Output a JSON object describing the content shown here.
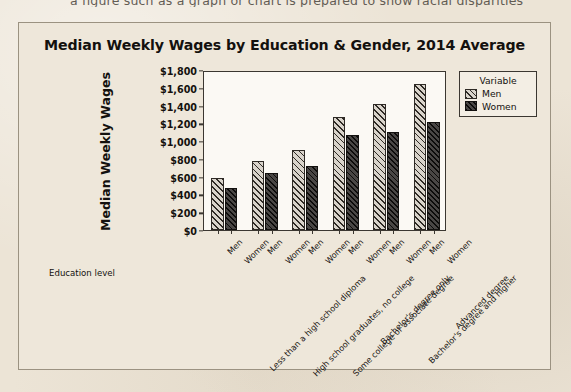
{
  "page": {
    "cut_off_line": "a figure such as a graph or chart is prepared to show racial disparities",
    "background_color": "#ece4d6"
  },
  "chart_data": {
    "type": "bar",
    "title": "Median Weekly Wages by Education & Gender, 2014 Average",
    "xlabel": "Education level",
    "ylabel": "Median Weekly Wages",
    "ylim": [
      0,
      1800
    ],
    "grid": false,
    "legend_position": "right",
    "legend_title": "Variable",
    "yticks": [
      "$0",
      "$200",
      "$400",
      "$600",
      "$800",
      "$1,000",
      "$1,200",
      "$1,400",
      "$1,600",
      "$1,800"
    ],
    "ytick_values": [
      0,
      200,
      400,
      600,
      800,
      1000,
      1200,
      1400,
      1600,
      1800
    ],
    "categories": [
      "Less than a high school diploma",
      "High school graduates, no college",
      "Some college or associate degree",
      "Bachelor's degree only",
      "Bachelor's degree and higher",
      "Advanced degree"
    ],
    "group_tick_labels": [
      "Men",
      "Women"
    ],
    "series": [
      {
        "name": "Men",
        "pattern": "diagonal-hatch-light",
        "values": [
          580,
          780,
          895,
          1270,
          1415,
          1640
        ]
      },
      {
        "name": "Women",
        "pattern": "diagonal-hatch-dark",
        "values": [
          475,
          645,
          725,
          1065,
          1100,
          1210
        ]
      }
    ]
  }
}
